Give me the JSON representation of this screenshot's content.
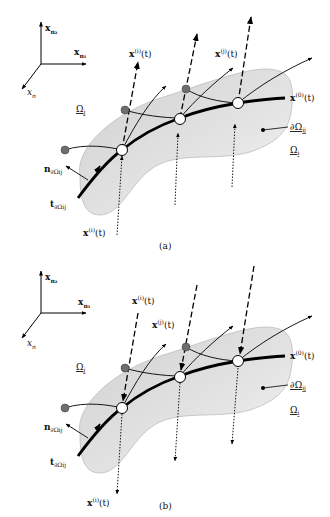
{
  "figure": {
    "panels": [
      {
        "id": "a",
        "caption": "(a)",
        "axes": {
          "up": "x",
          "up_sub": "n₂",
          "right": "x",
          "right_sub": "n₁",
          "diag": "x",
          "diag_sub": "n"
        },
        "labels": {
          "xj_i": "x",
          "xj_i_sub": "j",
          "xj_i_sup": "(i)",
          "xj_i_t": "(t)",
          "x_j": "x",
          "x_j_sup": "(j)",
          "x_j_t": "(t)",
          "x_0": "x",
          "x_0_sup": "(0)",
          "x_0_t": "(t)",
          "x_i": "x",
          "x_i_sup": "(i)",
          "x_i_t": "(t)",
          "omega_j": "Ω",
          "omega_j_sub": "j",
          "omega_i": "Ω",
          "omega_i_sub": "i",
          "boundary": "∂Ω",
          "boundary_sub": "ij",
          "normal": "n",
          "normal_sub": "∂Ωij",
          "tangent": "t",
          "tangent_sub": "∂Ωij"
        }
      },
      {
        "id": "b",
        "caption": "(b)",
        "axes": {
          "up": "x",
          "up_sub": "n₂",
          "right": "x",
          "right_sub": "n₁",
          "diag": "x",
          "diag_sub": "n"
        },
        "labels": {
          "xj_i": "x",
          "xj_i_sub": "j",
          "xj_i_sup": "(i)",
          "xj_i_t": "(t)",
          "x_j": "x",
          "x_j_sup": "(j)",
          "x_j_t": "(t)",
          "x_0": "x",
          "x_0_sup": "(0)",
          "x_0_t": "(t)",
          "x_i": "x",
          "x_i_sup": "(i)",
          "x_i_t": "(t)",
          "omega_j": "Ω",
          "omega_j_sub": "j",
          "omega_i": "Ω",
          "omega_i_sub": "i",
          "boundary": "∂Ω",
          "boundary_sub": "ij",
          "normal": "n",
          "normal_sub": "∂Ωij",
          "tangent": "t",
          "tangent_sub": "∂Ωij"
        }
      }
    ],
    "colors": {
      "region_fill": "#d9d9d9",
      "region_stroke": "#bdbdbd",
      "curve": "#000000",
      "grey_node": "#6e6e6e",
      "white_node": "#ffffff"
    }
  }
}
